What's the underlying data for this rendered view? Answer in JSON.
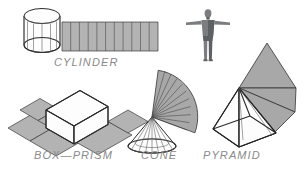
{
  "page": {
    "background_color": "#ffffff",
    "width": 305,
    "height": 171
  },
  "palette": {
    "net_fill": "#b3b3b3",
    "net_stroke": "#3a3a3a",
    "solid_fill": "#fdfdfd",
    "solid_stroke": "#2b2b2b",
    "label_color": "#8a8a8a",
    "figure_color": "#7b7d80"
  },
  "figures": [
    {
      "id": "cylinder",
      "label": "CYLINDER",
      "label_x": 54,
      "label_y": 66,
      "solid_type": "cylinder",
      "net_type": "rectangle-strip",
      "net_divisions": 11,
      "description": "Right circular cylinder with its lateral surface unrolled into a rectangle"
    },
    {
      "id": "box-prism",
      "label": "BOX—PRISM",
      "label_x": 34,
      "label_y": 159,
      "solid_type": "rectangular-prism",
      "net_type": "cross-net",
      "net_divisions": 4,
      "description": "Rectangular box resting on its unfolded cross shaped net"
    },
    {
      "id": "cone",
      "label": "CONE",
      "label_x": 141,
      "label_y": 159,
      "solid_type": "cone",
      "net_type": "circular-sector",
      "net_divisions": 14,
      "description": "Right circular cone with its lateral surface unrolled into a sector fan"
    },
    {
      "id": "pyramid",
      "label": "PYRAMID",
      "label_x": 203,
      "label_y": 159,
      "solid_type": "square-pyramid",
      "net_type": "triangle-flaps",
      "net_divisions": 3,
      "description": "Square pyramid with triangular lateral faces folded outward"
    },
    {
      "id": "human-scale-figure",
      "label": "",
      "solid_type": "human-figure",
      "net_type": "none",
      "description": "Standing human figure in T-pose shown for scale reference"
    }
  ]
}
